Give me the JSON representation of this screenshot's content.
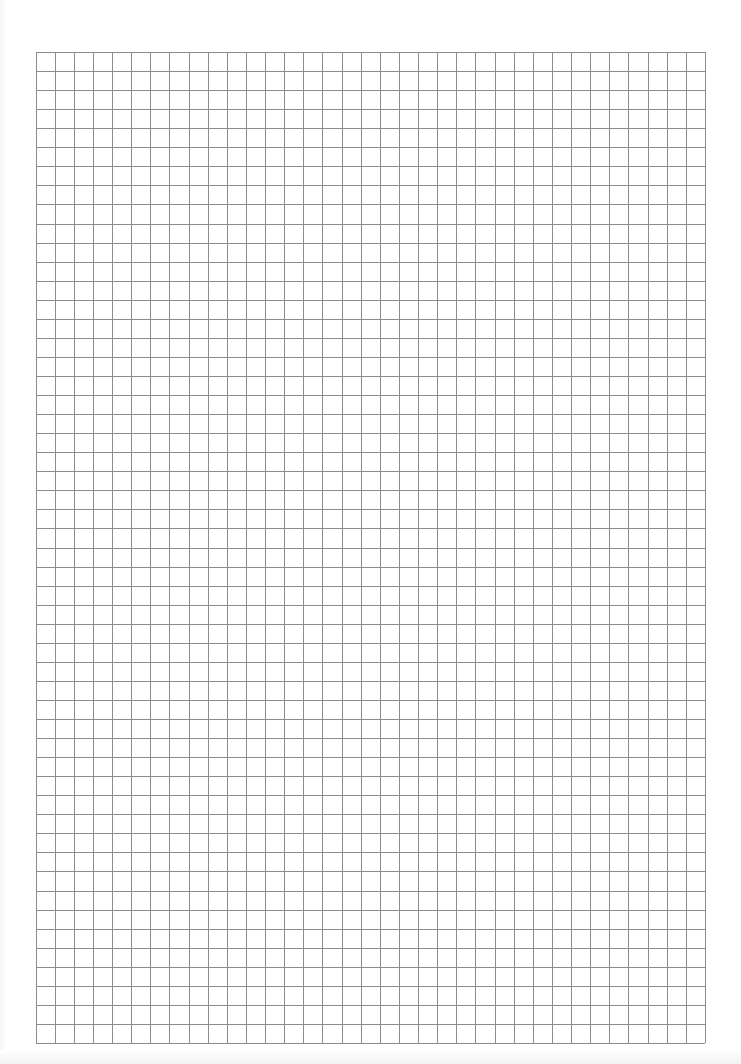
{
  "document": {
    "type": "graph-paper",
    "grid": {
      "columns": 35,
      "rows": 52,
      "left": 35.5,
      "top": 52,
      "right": 705,
      "bottom": 1043,
      "line_color": "#8c8c8c",
      "line_width": 1
    },
    "background_color": "#ffffff"
  }
}
